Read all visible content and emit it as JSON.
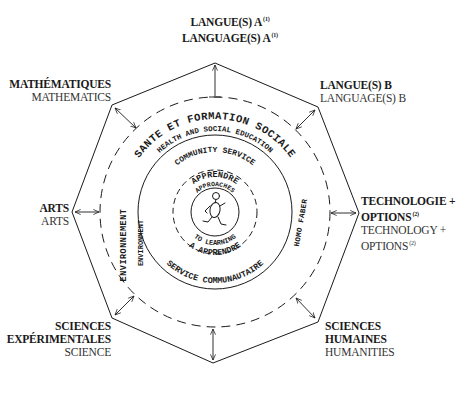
{
  "diagram": {
    "title_hint": "IB Diploma Programme hexagon/octagon curriculum model",
    "subject_groups": [
      {
        "id": "langue-a",
        "fr": "LANGUE(S) A",
        "fr_note": "(1)",
        "en": "LANGUAGE(S) A",
        "en_note": "(1)",
        "position": "top"
      },
      {
        "id": "langue-b",
        "fr": "LANGUE(S) B",
        "en": "LANGUAGE(S) B",
        "position": "top-right"
      },
      {
        "id": "technologie",
        "fr": "TECHNOLOGIE +",
        "fr2": "OPTIONS",
        "fr_note": "(2)",
        "en": "TECHNOLOGY +",
        "en2": "OPTIONS",
        "en_note": "(2)",
        "position": "right"
      },
      {
        "id": "sciences-humaines",
        "fr": "SCIENCES",
        "fr2": "HUMAINES",
        "en": "HUMANITIES",
        "position": "bottom-right"
      },
      {
        "id": "sciences-experimentales",
        "fr": "SCIENCES",
        "fr2": "EXPÉRIMENTALES",
        "en": "SCIENCE",
        "position": "bottom-left"
      },
      {
        "id": "arts",
        "fr": "ARTS",
        "en": "ARTS",
        "position": "left"
      },
      {
        "id": "mathematiques",
        "fr": "MATHÉMATIQUES",
        "en": "MATHEMATICS",
        "position": "top-left"
      }
    ],
    "rings": {
      "outer_dashed_top": "SANTE ET FORMATION SOCIALE",
      "outer_dashed_top_en": "HEALTH AND SOCIAL EDUCATION",
      "outer_dashed_left": "ENVIRONNEMENT",
      "outer_dashed_left_en": "ENVIRONMENT",
      "outer_dashed_right": "HOMO FABER",
      "solid_top": "COMMUNITY SERVICE",
      "solid_bottom": "SERVICE COMMUNAUTAIRE",
      "inner_dashed_top": "APPRENDRE",
      "inner_top_en": "APPROACHES",
      "inner_bottom_en": "TO LEARNING",
      "inner_dashed_bottom": "A APPRENDRE"
    },
    "center_icon": "running-figure",
    "colors": {
      "ink": "#1a1a1a",
      "background": "#ffffff"
    }
  }
}
